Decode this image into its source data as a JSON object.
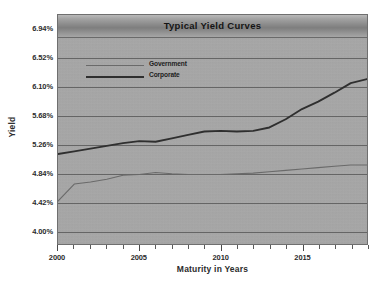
{
  "chart_data": {
    "type": "line",
    "title": "Typical Yield Curves",
    "xlabel": "Maturity in Years",
    "ylabel": "Yield",
    "grid": true,
    "legend_position": "upper-left-inside",
    "xlim": [
      2000,
      2019
    ],
    "ylim": [
      3.79,
      7.15
    ],
    "x": [
      2000,
      2001,
      2002,
      2003,
      2004,
      2005,
      2006,
      2007,
      2008,
      2009,
      2010,
      2011,
      2012,
      2013,
      2014,
      2015,
      2016,
      2017,
      2018,
      2019
    ],
    "xticks": [
      2000,
      2005,
      2010,
      2015
    ],
    "xtick_labels": [
      "2000",
      "2005",
      "2010",
      "2015"
    ],
    "yticks": [
      4.0,
      4.42,
      4.84,
      5.26,
      5.68,
      6.1,
      6.52,
      6.94
    ],
    "ytick_labels": [
      "4.00%",
      "4.42%",
      "4.84%",
      "5.26%",
      "5.68%",
      "6.10%",
      "6.52%",
      "6.94%"
    ],
    "series": [
      {
        "name": "Government",
        "color": "#6a6a6a",
        "width": 1.1,
        "values": [
          4.42,
          4.67,
          4.7,
          4.74,
          4.8,
          4.81,
          4.84,
          4.82,
          4.81,
          4.81,
          4.81,
          4.82,
          4.83,
          4.85,
          4.87,
          4.89,
          4.91,
          4.93,
          4.95,
          4.95
        ]
      },
      {
        "name": "Corporate",
        "color": "#2f2f2f",
        "width": 1.9,
        "values": [
          5.11,
          5.15,
          5.19,
          5.23,
          5.27,
          5.3,
          5.29,
          5.34,
          5.39,
          5.44,
          5.45,
          5.44,
          5.45,
          5.5,
          5.62,
          5.77,
          5.88,
          6.01,
          6.15,
          6.21
        ]
      }
    ]
  },
  "legend": {
    "items": [
      {
        "label": "Government"
      },
      {
        "label": "Corporate"
      }
    ]
  }
}
